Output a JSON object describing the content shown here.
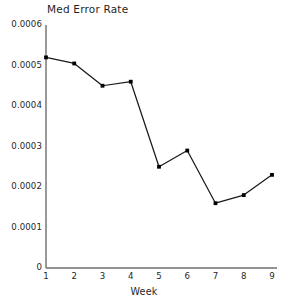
{
  "chart_data": {
    "type": "line",
    "title": "Med Error Rate",
    "xlabel": "Week",
    "ylabel": "",
    "categories": [
      1,
      2,
      3,
      4,
      5,
      6,
      7,
      8,
      9
    ],
    "values": [
      0.00052,
      0.000505,
      0.00045,
      0.00046,
      0.00025,
      0.00029,
      0.00016,
      0.00018,
      0.00023
    ],
    "series": [
      {
        "name": "Med Error Rate",
        "values": [
          0.00052,
          0.000505,
          0.00045,
          0.00046,
          0.00025,
          0.00029,
          0.00016,
          0.00018,
          0.00023
        ]
      }
    ],
    "xlim": [
      1,
      9
    ],
    "ylim": [
      0,
      0.0006
    ],
    "xticks": [
      "1",
      "2",
      "3",
      "4",
      "5",
      "6",
      "7",
      "8",
      "9"
    ],
    "yticks": [
      "0",
      "0.0001",
      "0.0002",
      "0.0003",
      "0.0004",
      "0.0005",
      "0.0006"
    ],
    "ytick_values": [
      0,
      0.0001,
      0.0002,
      0.0003,
      0.0004,
      0.0005,
      0.0006
    ],
    "grid": false,
    "legend": "none",
    "marker": "filled-square",
    "line_color": "#1a1a1a",
    "marker_color": "#000000",
    "axis_color": "#6f6f6f"
  },
  "axis": {
    "y_labels": [
      "0.0006",
      "0.0005",
      "0.0004",
      "0.0003",
      "0.0002",
      "0.0001",
      "0"
    ],
    "x_labels": [
      "1",
      "2",
      "3",
      "4",
      "5",
      "6",
      "7",
      "8",
      "9"
    ],
    "x_title": "Week"
  }
}
